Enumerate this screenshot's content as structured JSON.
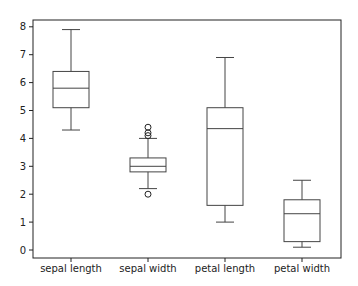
{
  "chart_data": {
    "type": "box",
    "title": "",
    "xlabel": "",
    "ylabel": "",
    "ylim": [
      -0.3,
      8.25
    ],
    "yticks": [
      0,
      1,
      2,
      3,
      4,
      5,
      6,
      7,
      8
    ],
    "grid": false,
    "legend": null,
    "categories": [
      "sepal length",
      "sepal width",
      "petal length",
      "petal width"
    ],
    "series": [
      {
        "name": "sepal length",
        "whisker_low": 4.3,
        "q1": 5.1,
        "median": 5.8,
        "q3": 6.4,
        "whisker_high": 7.9,
        "outliers": []
      },
      {
        "name": "sepal width",
        "whisker_low": 2.2,
        "q1": 2.8,
        "median": 3.0,
        "q3": 3.3,
        "whisker_high": 4.0,
        "outliers": [
          2.0,
          4.1,
          4.2,
          4.4
        ]
      },
      {
        "name": "petal length",
        "whisker_low": 1.0,
        "q1": 1.6,
        "median": 4.35,
        "q3": 5.1,
        "whisker_high": 6.9,
        "outliers": []
      },
      {
        "name": "petal width",
        "whisker_low": 0.1,
        "q1": 0.3,
        "median": 1.3,
        "q3": 1.8,
        "whisker_high": 2.5,
        "outliers": []
      }
    ],
    "colors": {
      "box": "#444444",
      "axis": "#222222",
      "outlier": "#222222"
    }
  }
}
